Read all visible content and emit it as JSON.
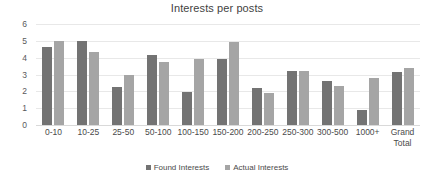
{
  "chart_data": {
    "type": "bar",
    "title": "Interests per posts",
    "xlabel": "",
    "ylabel": "",
    "ylim": [
      0,
      6
    ],
    "yticks": [
      6,
      5,
      4,
      3,
      2,
      1,
      0
    ],
    "grid": true,
    "legend_position": "bottom",
    "categories": [
      "0-10",
      "10-25",
      "25-50",
      "50-100",
      "100-150",
      "150-200",
      "200-250",
      "250-300",
      "300-500",
      "1000+",
      "Grand\nTotal"
    ],
    "series": [
      {
        "name": "Found Interests",
        "color": "#737373",
        "values": [
          4.65,
          5.0,
          2.28,
          4.15,
          1.95,
          3.92,
          2.2,
          3.22,
          2.6,
          0.87,
          3.17
        ]
      },
      {
        "name": "Actual Interests",
        "color": "#a5a5a5",
        "values": [
          5.0,
          4.33,
          2.95,
          3.75,
          3.92,
          4.92,
          1.9,
          3.22,
          2.33,
          2.82,
          3.38
        ]
      }
    ]
  }
}
